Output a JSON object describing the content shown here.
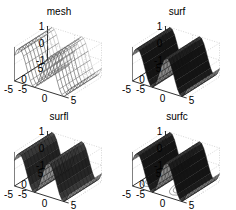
{
  "chart_data": [
    {
      "type": "surface3d",
      "title": "mesh",
      "style": "wireframe",
      "function": "z = sin(x) (varying along x, constant along y)",
      "x_range": [
        -5,
        5
      ],
      "y_range": [
        -5,
        5
      ],
      "z_range": [
        -1,
        1
      ],
      "x_ticks": [
        "-5",
        "0",
        "5"
      ],
      "y_ticks": [
        "-5",
        "0",
        "5"
      ],
      "z_ticks": [
        "-1",
        "0",
        "1"
      ],
      "grid": true
    },
    {
      "type": "surface3d",
      "title": "surf",
      "style": "shaded surface",
      "x_range": [
        -5,
        5
      ],
      "y_range": [
        -5,
        5
      ],
      "z_range": [
        -1,
        1
      ],
      "x_ticks": [
        "-5",
        "0",
        "5"
      ],
      "y_ticks": [
        "-5",
        "0",
        "5"
      ],
      "z_ticks": [
        "-1",
        "0",
        "1"
      ],
      "grid": true
    },
    {
      "type": "surface3d",
      "title": "surfl",
      "style": "lit surface",
      "x_range": [
        -5,
        5
      ],
      "y_range": [
        -5,
        5
      ],
      "z_range": [
        -1,
        1
      ],
      "x_ticks": [
        "-5",
        "0",
        "5"
      ],
      "y_ticks": [
        "-5",
        "0",
        "5"
      ],
      "z_ticks": [
        "-1",
        "0",
        "1"
      ],
      "grid": true
    },
    {
      "type": "surface3d",
      "title": "surfc",
      "style": "surface with contour",
      "x_range": [
        -5,
        5
      ],
      "y_range": [
        -5,
        5
      ],
      "z_range": [
        -1,
        1
      ],
      "x_ticks": [
        "-5",
        "0",
        "5"
      ],
      "y_ticks": [
        "-5",
        "0",
        "5"
      ],
      "z_ticks": [
        "-1",
        "0",
        "1"
      ],
      "grid": true
    }
  ],
  "panels": [
    {
      "title": "mesh"
    },
    {
      "title": "surf"
    },
    {
      "title": "surfl"
    },
    {
      "title": "surfc"
    }
  ],
  "ticks": {
    "z_top": "1",
    "z_mid": "0",
    "z_bot": "-1",
    "y_far": "5",
    "y_mid": "0",
    "y_near": "-5",
    "x_near": "-5",
    "x_mid": "0",
    "x_far": "5"
  }
}
